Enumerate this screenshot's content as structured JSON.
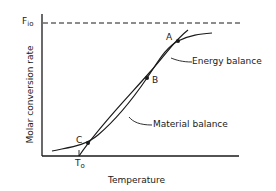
{
  "diagram": {
    "y_axis_label": "Molar conversion rate",
    "x_axis_label": "Temperature",
    "asymptote_label": "F",
    "asymptote_sub": "io",
    "x_tick_label": "T",
    "x_tick_sub": "o",
    "curves": [
      {
        "name": "Energy balance",
        "label": "Energy balance"
      },
      {
        "name": "Material balance",
        "label": "Material balance"
      }
    ],
    "points": [
      {
        "label": "A"
      },
      {
        "label": "B"
      },
      {
        "label": "C"
      }
    ]
  }
}
